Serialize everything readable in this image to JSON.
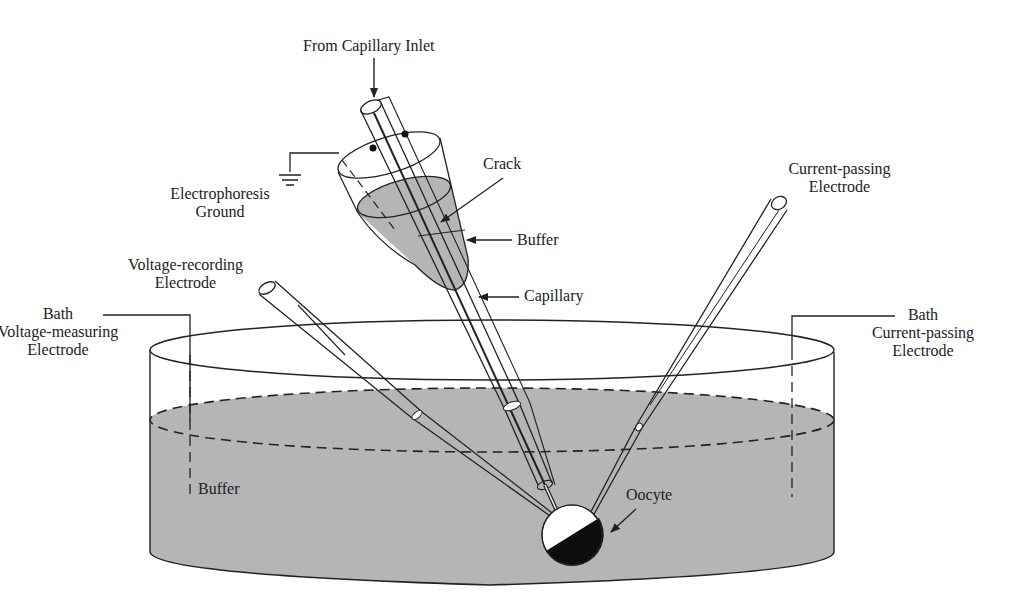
{
  "diagram": {
    "colors": {
      "buffer_fill": "#b5b5b5",
      "line": "#222222",
      "oocyte_dark": "#0d0d0d",
      "background": "#ffffff"
    },
    "labels": {
      "capillary_inlet": "From Capillary Inlet",
      "crack": "Crack",
      "buffer_cone": "Buffer",
      "capillary": "Capillary",
      "electrophoresis_ground_line1": "Electrophoresis",
      "electrophoresis_ground_line2": "Ground",
      "voltage_recording_line1": "Voltage-recording",
      "voltage_recording_line2": "Electrode",
      "current_passing_line1": "Current-passing",
      "current_passing_line2": "Electrode",
      "bath_voltage_line1": "Bath",
      "bath_voltage_line2": "Voltage-measuring",
      "bath_voltage_line3": "Electrode",
      "bath_current_line1": "Bath",
      "bath_current_line2": "Current-passing",
      "bath_current_line3": "Electrode",
      "bath_buffer": "Buffer",
      "oocyte": "Oocyte"
    },
    "icons": {
      "ground": "electrical-ground-symbol",
      "arrow": "arrow-pointer"
    }
  }
}
